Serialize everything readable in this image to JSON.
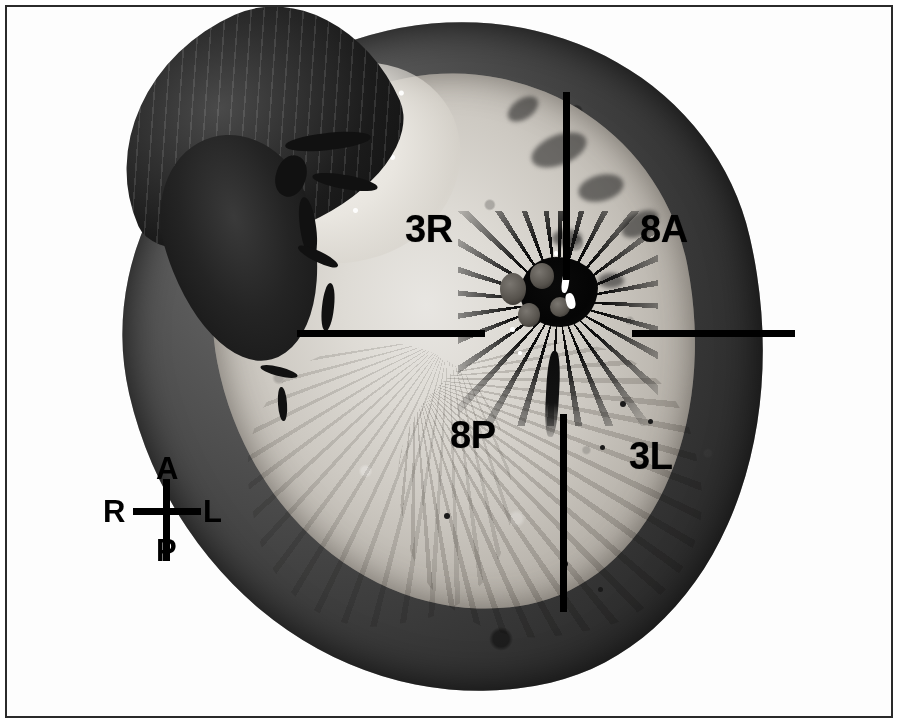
{
  "figure": {
    "kind": "anatomical-cross-section-photograph",
    "modality": "gross-pathology-macrophotograph",
    "color_mode": "grayscale",
    "frame": {
      "visible": true,
      "color": "#2a2a2a"
    },
    "background_color": "#ffffff"
  },
  "specimen": {
    "description": "Transverse gross section of an organ showing a dark peripheral rim, pale granular parenchyma, a dark lobed appendage at the upper left, and a dark stellate hilum at the center.",
    "rim_color": "#3f3f3f",
    "parenchyma_color": "#cdc9c2",
    "hilum_color": "#0d0d0d"
  },
  "overlay": {
    "line_color": "#000000",
    "axes": [
      {
        "id": "vertical-upper",
        "orientation": "vertical",
        "x": 556,
        "y": 85,
        "length": 188
      },
      {
        "id": "horizontal-left",
        "orientation": "horizontal",
        "x": 290,
        "y": 323,
        "length": 188
      },
      {
        "id": "horizontal-right",
        "orientation": "horizontal",
        "x": 625,
        "y": 323,
        "length": 163
      },
      {
        "id": "vertical-lower",
        "orientation": "vertical",
        "x": 553,
        "y": 407,
        "length": 198
      }
    ],
    "quadrant_labels": [
      {
        "id": "upper-left",
        "text": "3R",
        "x": 398,
        "y": 203
      },
      {
        "id": "upper-right",
        "text": "8A",
        "x": 633,
        "y": 203
      },
      {
        "id": "lower-left",
        "text": "8P",
        "x": 443,
        "y": 409
      },
      {
        "id": "lower-right",
        "text": "3L",
        "x": 622,
        "y": 430
      }
    ]
  },
  "compass": {
    "name": "orientation-key",
    "anterior": "A",
    "right": "R",
    "left": "L",
    "posterior": "P",
    "color": "#000000"
  }
}
